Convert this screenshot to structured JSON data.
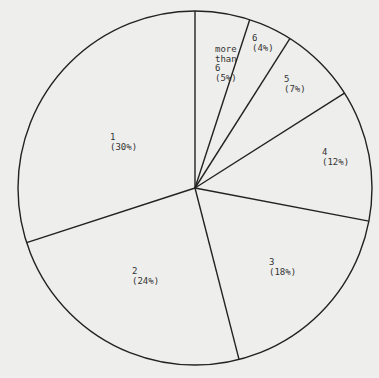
{
  "chart_data": {
    "type": "pie",
    "title": "",
    "start_angle_deg": 0,
    "direction": "clockwise",
    "categories": [
      "more than 6",
      "6",
      "5",
      "4",
      "3",
      "2",
      "1"
    ],
    "values": [
      5,
      4,
      7,
      12,
      18,
      24,
      30
    ],
    "labels": [
      {
        "name": "more\nthan\n6",
        "pct": "(5%)"
      },
      {
        "name": "6",
        "pct": "(4%)"
      },
      {
        "name": "5",
        "pct": "(7%)"
      },
      {
        "name": "4",
        "pct": "(12%)"
      },
      {
        "name": "3",
        "pct": "(18%)"
      },
      {
        "name": "2",
        "pct": "(24%)"
      },
      {
        "name": "1",
        "pct": "(30%)"
      }
    ],
    "unit": "%"
  },
  "style": {
    "background": "#eeeeec",
    "stroke": "#222222"
  }
}
